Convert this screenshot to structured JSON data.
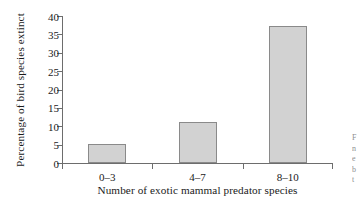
{
  "chart_data": {
    "type": "bar",
    "title": "",
    "subtitle": "",
    "xlabel": "Number of exotic mammal predator species",
    "ylabel": "Percentage of bird species extinct",
    "categories": [
      "0–3",
      "4–7",
      "8–10"
    ],
    "values": [
      5.2,
      11.2,
      37.4
    ],
    "series": [
      {
        "name": "Percentage of bird species extinct",
        "values": [
          5.2,
          11.2,
          37.4
        ]
      }
    ],
    "ylim": [
      0,
      40
    ],
    "ytick_labels": [
      "0",
      "5",
      "10",
      "15",
      "20",
      "25",
      "30",
      "35",
      "40"
    ],
    "ytick_values": [
      0,
      5,
      10,
      15,
      20,
      25,
      30,
      35,
      40
    ],
    "grid": false,
    "legend": false,
    "legend_position": "none",
    "bar_fill_color": "#d2d2d2",
    "bar_border_color": "#8a8a8a",
    "axis_color": "#6d6d6d",
    "background_color": "#ffffff",
    "text_color": "#1a1a1a"
  },
  "edge_fragment": {
    "lines": [
      "F",
      "n",
      "e",
      "b",
      "t"
    ]
  }
}
